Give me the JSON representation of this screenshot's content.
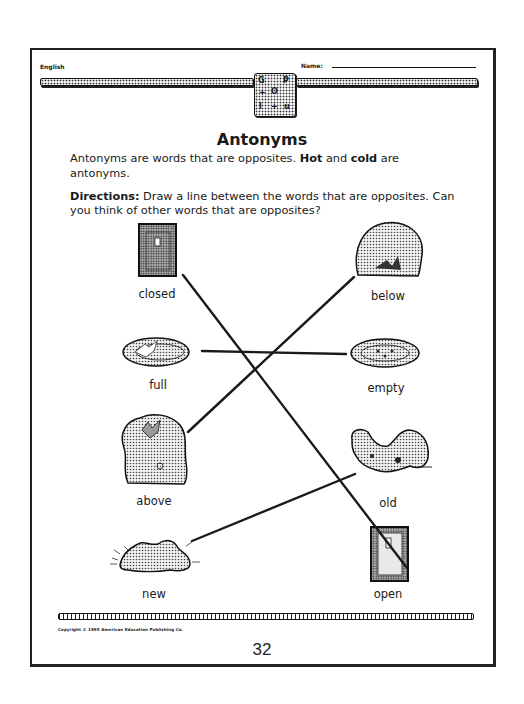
{
  "header": {
    "subject": "English",
    "name_label": "Name:",
    "logo_glyphs": [
      "G",
      "P",
      "+",
      "O",
      "l",
      "+",
      "u"
    ]
  },
  "title": "Antonyms",
  "intro": {
    "text_a": "Antonyms are words that are opposites. ",
    "hot": "Hot",
    "and": " and ",
    "cold": "cold",
    "text_b": " are antonyms."
  },
  "directions": {
    "label": "Directions:",
    "text": " Draw a line between the words that are opposites. Can you think of other words that are opposites?"
  },
  "left_items": [
    {
      "label": "closed",
      "picture": "closed-door"
    },
    {
      "label": "full",
      "picture": "full-plate"
    },
    {
      "label": "above",
      "picture": "bird-above-bush"
    },
    {
      "label": "new",
      "picture": "new-shoes"
    }
  ],
  "right_items": [
    {
      "label": "below",
      "picture": "bird-below-bush"
    },
    {
      "label": "empty",
      "picture": "empty-plate"
    },
    {
      "label": "old",
      "picture": "old-shoes"
    },
    {
      "label": "open",
      "picture": "open-door"
    }
  ],
  "matches": [
    {
      "from": "closed",
      "to": "open",
      "x1": 183,
      "y1": 275,
      "x2": 407,
      "y2": 568
    },
    {
      "from": "full",
      "to": "empty",
      "x1": 202,
      "y1": 351,
      "x2": 346,
      "y2": 354
    },
    {
      "from": "above",
      "to": "below",
      "x1": 188,
      "y1": 432,
      "x2": 354,
      "y2": 277
    },
    {
      "from": "new",
      "to": "old",
      "x1": 192,
      "y1": 541,
      "x2": 355,
      "y2": 474
    }
  ],
  "footer": {
    "copyright": "Copyright © 1995 American Education Publishing Co.",
    "page_number": "32"
  }
}
